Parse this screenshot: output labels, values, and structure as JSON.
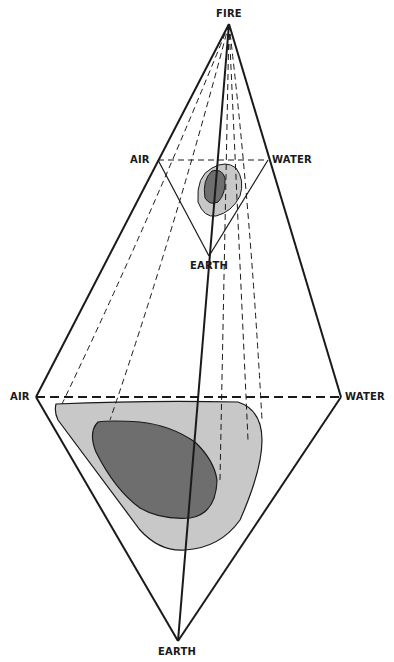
{
  "diagram": {
    "type": "tetrahedral element diagram",
    "colors": {
      "line": "#1a1a1a",
      "outer_region": "#c8c8c8",
      "inner_region": "#6e6e6e",
      "background": "#ffffff"
    },
    "labels": {
      "fire": "FIRE",
      "air_small": "AIR",
      "water_small": "WATER",
      "earth_small": "EARTH",
      "air_large": "AIR",
      "water_large": "WATER",
      "earth_large": "EARTH"
    },
    "vertices": {
      "fire": [
        229,
        24
      ],
      "small_air": [
        158,
        160
      ],
      "small_water": [
        268,
        160
      ],
      "small_earth": [
        209,
        256
      ],
      "large_air": [
        36,
        397
      ],
      "large_water": [
        341,
        397
      ],
      "large_earth": [
        178,
        641
      ]
    }
  }
}
